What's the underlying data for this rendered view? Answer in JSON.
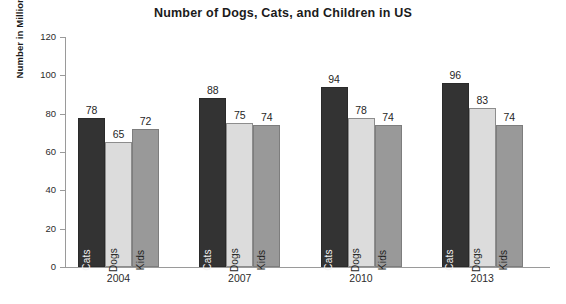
{
  "chart_data": {
    "type": "bar",
    "title": "Number of Dogs, Cats, and Children in US",
    "xlabel": "",
    "ylabel": "Number in Millions",
    "categories": [
      "2004",
      "2007",
      "2010",
      "2013"
    ],
    "series": [
      {
        "name": "Cats",
        "values": [
          78,
          88,
          94,
          96
        ],
        "color": "#333333"
      },
      {
        "name": "Dogs",
        "values": [
          65,
          75,
          78,
          83
        ],
        "color": "#dcdcdc"
      },
      {
        "name": "Kids",
        "values": [
          72,
          74,
          74,
          74
        ],
        "color": "#999999"
      }
    ],
    "ylim": [
      0,
      120
    ],
    "yticks": [
      0,
      20,
      40,
      60,
      80,
      100,
      120
    ],
    "ytick_labels": [
      "0",
      "20",
      "40",
      "60",
      "80",
      "100",
      "120"
    ],
    "grid": false,
    "legend": "none",
    "data_labels": true,
    "bar_inner_labels": [
      "Cats",
      "Dogs",
      "Kids"
    ],
    "axis_color": "#9a9a9a",
    "background": "#ffffff"
  }
}
